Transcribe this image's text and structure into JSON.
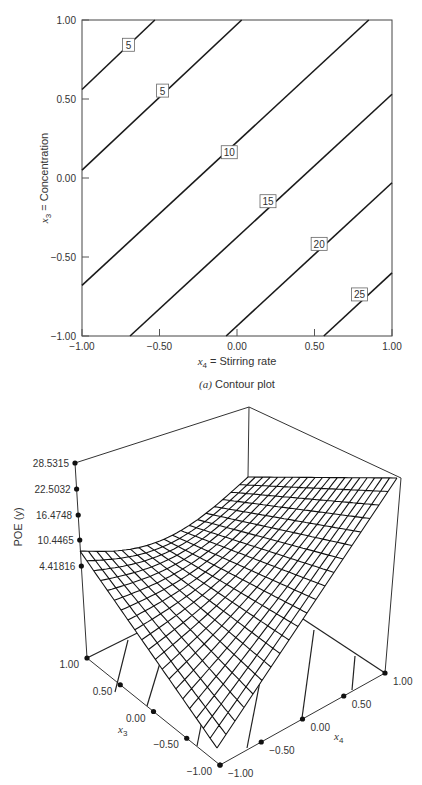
{
  "chart_data": [
    {
      "type": "contour",
      "title": "",
      "caption_prefix": "(a)",
      "caption_text": " Contour plot",
      "xlabel_var": "x",
      "xlabel_sub": "4",
      "xlabel_text": " = Stirring rate",
      "ylabel_var": "x",
      "ylabel_sub": "3",
      "ylabel_text": " = Concentration",
      "xlim": [
        -1.0,
        1.0
      ],
      "ylim": [
        -1.0,
        1.0
      ],
      "xticks": [
        "-1.00",
        "-0.50",
        "0.00",
        "0.50",
        "1.00"
      ],
      "yticks": [
        "1.00",
        "0.50",
        "0.00",
        "-0.50",
        "-1.00"
      ],
      "grid": false,
      "contours": [
        {
          "level": "5",
          "points": [
            [
              -1.0,
              0.56
            ],
            [
              -0.53,
              1.0
            ]
          ],
          "label_at": [
            -0.7,
            0.84
          ]
        },
        {
          "level": "5",
          "points": [
            [
              -1.0,
              0.05
            ],
            [
              0.03,
              1.0
            ]
          ],
          "label_at": [
            -0.48,
            0.55
          ]
        },
        {
          "level": "10",
          "points": [
            [
              -1.0,
              -0.68
            ],
            [
              0.85,
              1.0
            ]
          ],
          "label_at": [
            -0.05,
            0.16
          ]
        },
        {
          "level": "15",
          "points": [
            [
              -0.69,
              -1.0
            ],
            [
              1.0,
              0.53
            ]
          ],
          "label_at": [
            0.2,
            -0.15
          ]
        },
        {
          "level": "20",
          "points": [
            [
              -0.07,
              -1.0
            ],
            [
              1.0,
              -0.03
            ]
          ],
          "label_at": [
            0.53,
            -0.42
          ]
        },
        {
          "level": "25",
          "points": [
            [
              0.56,
              -1.0
            ],
            [
              1.0,
              -0.6
            ]
          ],
          "label_at": [
            0.79,
            -0.74
          ]
        }
      ]
    },
    {
      "type": "surface3d",
      "title": "",
      "zlabel": "POE (y)",
      "zticks": [
        "28.5315",
        "22.5032",
        "16.4748",
        "10.4465",
        "4.41816"
      ],
      "x3_label": "x",
      "x3_sub": "3",
      "x4_label": "x",
      "x4_sub": "4",
      "x3_ticks": [
        "1.00",
        "0.50",
        "0.00",
        "-0.50",
        "-1.00"
      ],
      "x4_ticks": [
        "-1.00",
        "-0.50",
        "0.00",
        "0.50",
        "1.00"
      ],
      "x3_range": [
        -1.0,
        1.0
      ],
      "x4_range": [
        -1.0,
        1.0
      ],
      "zlim": [
        4.41816,
        28.5315
      ],
      "grid_resolution": 20
    }
  ]
}
